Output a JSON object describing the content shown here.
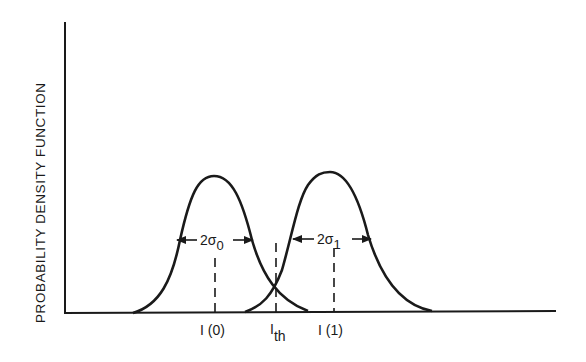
{
  "diagram": {
    "type": "probability-density-diagram",
    "y_axis_label": "PROBABILITY DENSITY FUNCTION",
    "curves": [
      {
        "name": "distribution-0",
        "mean_label": "I (0)",
        "width_label_main": "2σ",
        "width_label_sub": "0"
      },
      {
        "name": "distribution-1",
        "mean_label": "I (1)",
        "width_label_main": "2σ",
        "width_label_sub": "1"
      }
    ],
    "threshold": {
      "label_main": "I",
      "label_sub": "th"
    },
    "colors": {
      "line": "#1a1a1a",
      "background": "#ffffff"
    }
  }
}
